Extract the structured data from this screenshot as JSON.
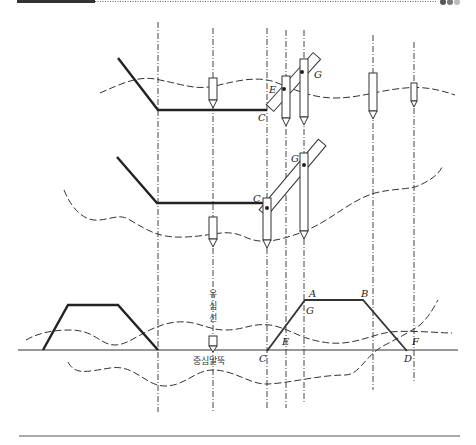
{
  "header": {
    "accent_bar_color": "#333333",
    "dots": [
      "#555555",
      "#777777",
      "#bbbbbb"
    ]
  },
  "panels": [
    {
      "id": "top",
      "labels": {
        "E": "E",
        "C": "C",
        "G": "G"
      }
    },
    {
      "id": "middle",
      "labels": {
        "C": "C",
        "G": "G"
      }
    },
    {
      "id": "bottom",
      "labels": {
        "A": "A",
        "B": "B",
        "G": "G",
        "E": "E",
        "C": "C",
        "D": "D",
        "F": "F"
      },
      "korean": {
        "vertical_label": "유심선",
        "stake_label": "중심말뚝"
      }
    }
  ]
}
